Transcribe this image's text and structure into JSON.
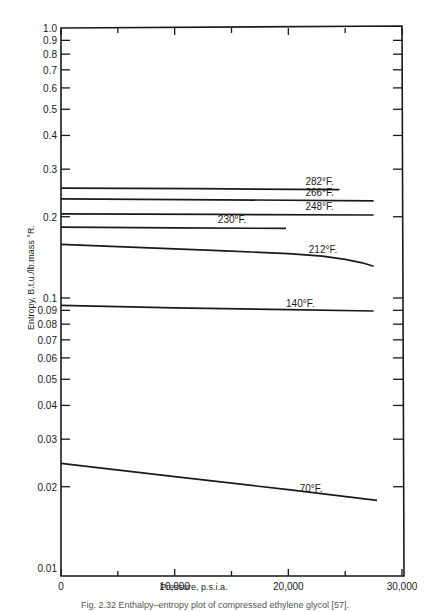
{
  "chart_data": {
    "type": "line",
    "title": "",
    "xlabel": "Pressure, p.s.i.a.",
    "ylabel": "Entropy, B.t.u./lb.mass °R.",
    "xscale": "linear",
    "yscale": "log",
    "xlim": [
      0,
      30000
    ],
    "ylim": [
      0.01,
      1.0
    ],
    "grid": false,
    "legend": "inline labels",
    "x_ticks": [
      {
        "value": 0,
        "label": "0"
      },
      {
        "value": 10000,
        "label": "10,000"
      },
      {
        "value": 20000,
        "label": "20,000"
      },
      {
        "value": 30000,
        "label": "30,000"
      }
    ],
    "x_minor_ticks": [
      5000,
      15000,
      25000
    ],
    "y_ticks": [
      {
        "value": 1.0,
        "label": "1.0"
      },
      {
        "value": 0.9,
        "label": "0.9"
      },
      {
        "value": 0.8,
        "label": "0.8"
      },
      {
        "value": 0.7,
        "label": "0.7"
      },
      {
        "value": 0.6,
        "label": "0.6"
      },
      {
        "value": 0.5,
        "label": "0.5"
      },
      {
        "value": 0.4,
        "label": "0.4"
      },
      {
        "value": 0.3,
        "label": "0.3"
      },
      {
        "value": 0.2,
        "label": "0.2"
      },
      {
        "value": 0.1,
        "label": "0.1"
      },
      {
        "value": 0.09,
        "label": "0.09"
      },
      {
        "value": 0.08,
        "label": "0.08"
      },
      {
        "value": 0.07,
        "label": "0.07"
      },
      {
        "value": 0.06,
        "label": "0.06"
      },
      {
        "value": 0.05,
        "label": "0.05"
      },
      {
        "value": 0.04,
        "label": "0.04"
      },
      {
        "value": 0.03,
        "label": "0.03"
      },
      {
        "value": 0.02,
        "label": "0.02"
      },
      {
        "value": 0.01,
        "label": "0.01"
      }
    ],
    "series": [
      {
        "name": "282°F.",
        "x": [
          0,
          12000,
          24500
        ],
        "y": [
          0.255,
          0.254,
          0.252
        ],
        "label_at": [
          21500,
          0.262
        ]
      },
      {
        "name": "266°F.",
        "x": [
          0,
          14000,
          27500
        ],
        "y": [
          0.233,
          0.231,
          0.229
        ],
        "label_at": [
          21500,
          0.238
        ]
      },
      {
        "name": "248°F.",
        "x": [
          0,
          14000,
          27500
        ],
        "y": [
          0.205,
          0.204,
          0.203
        ],
        "label_at": [
          21500,
          0.212
        ]
      },
      {
        "name": "230°F.",
        "x": [
          0,
          10000,
          19800
        ],
        "y": [
          0.183,
          0.182,
          0.181
        ],
        "label_at": [
          13800,
          0.19
        ]
      },
      {
        "name": "212°F.",
        "x": [
          0,
          5000,
          10000,
          15000,
          20000,
          23000,
          25000,
          26500,
          27500
        ],
        "y": [
          0.158,
          0.155,
          0.152,
          0.149,
          0.146,
          0.143,
          0.139,
          0.135,
          0.131
        ],
        "label_at": [
          21800,
          0.147
        ]
      },
      {
        "name": "140°F.",
        "x": [
          0,
          10000,
          20000,
          27500
        ],
        "y": [
          0.094,
          0.092,
          0.0905,
          0.0895
        ],
        "label_at": [
          19800,
          0.093
        ]
      },
      {
        "name": "70°F.",
        "x": [
          0,
          10000,
          20000,
          27800
        ],
        "y": [
          0.0244,
          0.0218,
          0.0195,
          0.0178
        ],
        "label_at": [
          21000,
          0.0192
        ]
      }
    ]
  },
  "caption": "Fig. 2.32   Enthalpy–entropy plot of compressed ethylene glycol [57]."
}
